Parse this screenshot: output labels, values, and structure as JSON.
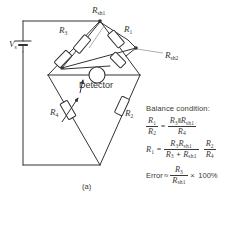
{
  "figure": {
    "label": "(a)",
    "type": "wheatstone-bridge-with-shunts"
  },
  "circuit": {
    "source_label": "V",
    "source_sub": "s",
    "detector_label": "Detector",
    "components": [
      {
        "name": "R3",
        "label": "R",
        "sub": "3",
        "kind": "resistor"
      },
      {
        "name": "R1",
        "label": "R",
        "sub": "1",
        "kind": "resistor"
      },
      {
        "name": "R4",
        "label": "R",
        "sub": "4",
        "kind": "potentiometer"
      },
      {
        "name": "R2",
        "label": "R",
        "sub": "2",
        "kind": "resistor"
      },
      {
        "name": "Rsh1",
        "label": "R",
        "sub": "sh1",
        "kind": "shunt-resistor"
      },
      {
        "name": "Rsh2",
        "label": "R",
        "sub": "sh2",
        "kind": "shunt-resistor"
      }
    ]
  },
  "equations": {
    "title": "Balance condition:",
    "eq1": {
      "lhs_num": "R",
      "lhs_num_sub": "1",
      "lhs_den": "R",
      "lhs_den_sub": "2",
      "rel": "=",
      "rhs_num_a": "R",
      "rhs_num_a_sub": "3",
      "parallel": "‖",
      "rhs_num_b": "R",
      "rhs_num_b_sub": "sh1",
      "rhs_den": "R",
      "rhs_den_sub": "4"
    },
    "eq2": {
      "lhs": "R",
      "lhs_sub": "1",
      "rel": "=",
      "f1_num_a": "R",
      "f1_num_a_sub": "3",
      "f1_num_b": "R",
      "f1_num_b_sub": "sh1",
      "f1_den_a": "R",
      "f1_den_a_sub": "3",
      "plus": "+",
      "f1_den_b": "R",
      "f1_den_b_sub": "sh1",
      "f2_num": "R",
      "f2_num_sub": "2",
      "f2_den": "R",
      "f2_den_sub": "4"
    },
    "eq3": {
      "label": "Error",
      "rel": "≈",
      "num": "R",
      "num_sub": "3",
      "den": "R",
      "den_sub": "sh1",
      "times": "×",
      "value": "100%"
    }
  },
  "colors": {
    "ink": "#333333",
    "background": "#ffffff"
  }
}
